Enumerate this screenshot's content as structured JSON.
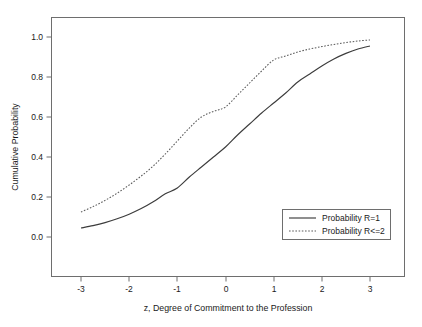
{
  "chart_data": {
    "type": "line",
    "title": "",
    "xlabel": "z, Degree of Commitment to the Profession",
    "ylabel": "Cumulative Probability",
    "xlim": [
      -3.5,
      3.5
    ],
    "ylim": [
      -0.06,
      1.08
    ],
    "xticks": [
      -3,
      -2,
      -1,
      0,
      1,
      2,
      3
    ],
    "xticklabels": [
      "-3",
      "-2",
      "-1",
      "0",
      "1",
      "2",
      "3"
    ],
    "yticks": [
      0.0,
      0.2,
      0.4,
      0.6,
      0.8,
      1.0
    ],
    "yticklabels": [
      "0.0",
      "0.2",
      "0.4",
      "0.6",
      "0.8",
      "1.0"
    ],
    "grid": false,
    "legend_position": "lower right",
    "x": [
      -3.0,
      -2.75,
      -2.5,
      -2.25,
      -2.0,
      -1.75,
      -1.5,
      -1.25,
      -1.0,
      -0.75,
      -0.5,
      -0.25,
      0.0,
      0.25,
      0.5,
      0.75,
      1.0,
      1.25,
      1.5,
      1.75,
      2.0,
      2.25,
      2.5,
      2.75,
      3.0
    ],
    "series": [
      {
        "name": "Probability R=1",
        "style": "solid",
        "color": "#3c3c3c",
        "values": [
          0.045,
          0.057,
          0.072,
          0.091,
          0.114,
          0.142,
          0.176,
          0.216,
          0.245,
          0.3,
          0.35,
          0.4,
          0.45,
          0.51,
          0.565,
          0.62,
          0.67,
          0.72,
          0.775,
          0.815,
          0.855,
          0.89,
          0.918,
          0.94,
          0.955
        ]
      },
      {
        "name": "Probability R<=2",
        "style": "dotted",
        "color": "#5a5a5a",
        "values": [
          0.125,
          0.152,
          0.183,
          0.219,
          0.26,
          0.305,
          0.355,
          0.415,
          0.48,
          0.545,
          0.6,
          0.628,
          0.65,
          0.71,
          0.77,
          0.83,
          0.885,
          0.905,
          0.925,
          0.94,
          0.952,
          0.963,
          0.972,
          0.98,
          0.985
        ]
      }
    ]
  },
  "legend": {
    "entries": [
      {
        "label": "Probability R=1"
      },
      {
        "label": "Probability R<=2"
      }
    ]
  },
  "colors": {
    "background": "#ffffff",
    "frame": "#6e6e6e",
    "text": "#1a1a1a",
    "series_solid": "#3c3c3c",
    "series_dotted": "#5a5a5a"
  }
}
